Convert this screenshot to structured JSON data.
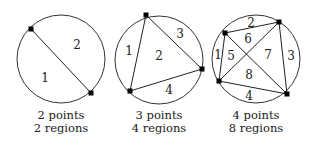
{
  "figure": {
    "panels": [
      {
        "id": "panel-2-points",
        "center": [
          61,
          59
        ],
        "radius": 44,
        "points": [
          [
            31,
            29
          ],
          [
            91,
            93
          ]
        ],
        "chords": [
          [
            0,
            1
          ]
        ],
        "regions": [
          {
            "label": "1",
            "pos": [
              45,
              78
            ]
          },
          {
            "label": "2",
            "pos": [
              77,
              45
            ]
          }
        ],
        "caption_line1": "2 points",
        "caption_line2": "2 regions"
      },
      {
        "id": "panel-3-points",
        "center": [
          159,
          60
        ],
        "radius": 44,
        "points": [
          [
            146,
            15
          ],
          [
            202,
            69
          ],
          [
            130,
            91
          ]
        ],
        "chords": [
          [
            0,
            1
          ],
          [
            1,
            2
          ],
          [
            2,
            0
          ]
        ],
        "regions": [
          {
            "label": "1",
            "pos": [
              129,
              51
            ]
          },
          {
            "label": "2",
            "pos": [
              159,
              56
            ]
          },
          {
            "label": "3",
            "pos": [
              180,
              34
            ]
          },
          {
            "label": "4",
            "pos": [
              169,
              90
            ]
          }
        ],
        "caption_line1": "3 points",
        "caption_line2": "4 regions"
      },
      {
        "id": "panel-4-points",
        "center": [
          256,
          59
        ],
        "radius": 44,
        "points": [
          [
            225,
            33
          ],
          [
            279,
            22
          ],
          [
            287,
            94
          ],
          [
            219,
            81
          ]
        ],
        "chords": [
          [
            0,
            1
          ],
          [
            1,
            2
          ],
          [
            2,
            3
          ],
          [
            3,
            0
          ],
          [
            0,
            2
          ],
          [
            1,
            3
          ]
        ],
        "regions": [
          {
            "label": "1",
            "pos": [
              218,
              55
            ]
          },
          {
            "label": "2",
            "pos": [
              251,
              23
            ]
          },
          {
            "label": "3",
            "pos": [
              291,
              56
            ]
          },
          {
            "label": "4",
            "pos": [
              249,
              96
            ]
          },
          {
            "label": "5",
            "pos": [
              231,
              56
            ]
          },
          {
            "label": "6",
            "pos": [
              248,
              39
            ]
          },
          {
            "label": "7",
            "pos": [
              268,
              55
            ]
          },
          {
            "label": "8",
            "pos": [
              249,
              75
            ]
          }
        ],
        "caption_line1": "4 points",
        "caption_line2": "8 regions"
      }
    ]
  }
}
